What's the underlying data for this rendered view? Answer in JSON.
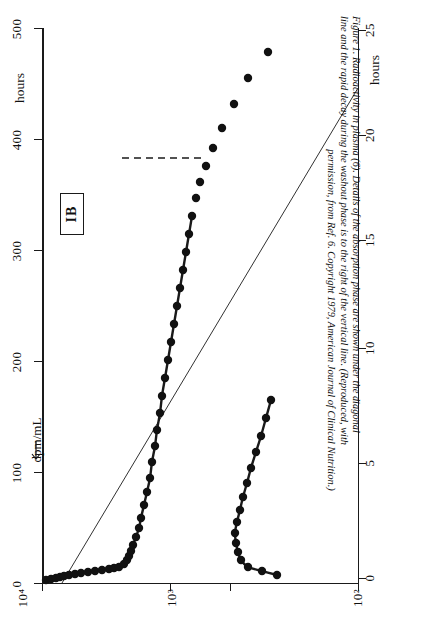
{
  "figure": {
    "panel_label": "IB",
    "caption_lines": [
      "Figure 1.   Radioactivity in plasma (6).  Details of the absorption phase are shown under the diagonal",
      "line and the rapid decay during the washout phase is to the right of the vertical line.  (Reproduced, with",
      "permission, from Ref. 6.  Copyright 1979, American Journal of Clinical Nutrition.)"
    ],
    "ink_color": "#1a1a1a",
    "background": "#ffffff"
  },
  "chart_data": {
    "type": "scatter",
    "title": "Radioactivity in plasma",
    "orientation": "rotated-90",
    "xlabel": "dpm/mL",
    "ylabel": "hours",
    "ylim": [
      0,
      500
    ],
    "yticks": [
      0,
      100,
      200,
      300,
      400,
      500
    ],
    "ytick_labels": [
      "0",
      "100",
      "200",
      "300",
      "400",
      "500"
    ],
    "y_axis_title": "hours",
    "x_scale": "log-descending",
    "xlim": [
      10000,
      100
    ],
    "xticks": [
      10000,
      1000,
      100
    ],
    "xtick_labels": [
      "10⁴",
      "10³",
      "10²"
    ],
    "x_axis_title": "dpm/mL",
    "secondary_axis": {
      "label": "hours",
      "ticks": [
        0,
        5,
        10,
        15,
        20,
        25
      ],
      "tick_labels": [
        "0",
        "5",
        "10",
        "15",
        "20",
        "25"
      ],
      "position": "right-and-bottom"
    },
    "grid": false,
    "legend": false,
    "series": [
      {
        "name": "absorption-phase",
        "style": "filled-circles-with-fitted-curve",
        "marker": "filled-circle",
        "points_px": [
          [
            46,
            580
          ],
          [
            51,
            579
          ],
          [
            56,
            578
          ],
          [
            60,
            577
          ],
          [
            64,
            576
          ],
          [
            69,
            575
          ],
          [
            75,
            574
          ],
          [
            81,
            573
          ],
          [
            88,
            572
          ],
          [
            95,
            571
          ],
          [
            102,
            570
          ],
          [
            109,
            569
          ],
          [
            114,
            568
          ],
          [
            119,
            567
          ],
          [
            124,
            564
          ],
          [
            127,
            560
          ],
          [
            129,
            556
          ],
          [
            131,
            551
          ],
          [
            133,
            545
          ],
          [
            136,
            537
          ],
          [
            139,
            528
          ],
          [
            141,
            518
          ],
          [
            144,
            505
          ],
          [
            147,
            492
          ],
          [
            150,
            478
          ],
          [
            152,
            462
          ],
          [
            155,
            446
          ],
          [
            157,
            430
          ],
          [
            160,
            413
          ],
          [
            162,
            396
          ],
          [
            165,
            378
          ],
          [
            168,
            360
          ],
          [
            171,
            342
          ],
          [
            174,
            324
          ],
          [
            177,
            306
          ],
          [
            180,
            288
          ],
          [
            183,
            270
          ],
          [
            186,
            252
          ],
          [
            189,
            234
          ],
          [
            192,
            216
          ]
        ]
      },
      {
        "name": "washout-phase",
        "style": "filled-circles-with-fitted-curve",
        "marker": "filled-circle",
        "points_px": [
          [
            277,
            575
          ],
          [
            262,
            571
          ],
          [
            248,
            567
          ],
          [
            241,
            560
          ],
          [
            238,
            552
          ],
          [
            236,
            543
          ],
          [
            235,
            533
          ],
          [
            237,
            522
          ],
          [
            240,
            510
          ],
          [
            243,
            497
          ],
          [
            247,
            483
          ],
          [
            251,
            468
          ],
          [
            256,
            452
          ],
          [
            261,
            436
          ],
          [
            266,
            418
          ],
          [
            271,
            400
          ]
        ]
      },
      {
        "name": "upper-scattered-points",
        "style": "filled-circles",
        "marker": "filled-circle",
        "points_px": [
          [
            196,
            198
          ],
          [
            200,
            182
          ],
          [
            206,
            166
          ],
          [
            213,
            148
          ],
          [
            222,
            128
          ],
          [
            234,
            104
          ],
          [
            248,
            78
          ],
          [
            268,
            52
          ]
        ]
      }
    ],
    "annotations": [
      {
        "type": "dashed-horizontal-line",
        "label": "plateau-reference",
        "y_px": 158,
        "x1_px": 122,
        "x2_px": 206
      },
      {
        "type": "diagonal-line",
        "label": "diagonal-reference",
        "x1_px": 62,
        "y1_px": 583,
        "x2_px": 358,
        "y2_px": 88
      },
      {
        "type": "arrow",
        "label": "dpm-per-mL-pointer",
        "x_px": 36,
        "y_px": 450
      }
    ]
  },
  "axes": {
    "left": {
      "title": "hours",
      "ticks": [
        {
          "label": "500",
          "y_px": 28
        },
        {
          "label": "400",
          "y_px": 139
        },
        {
          "label": "300",
          "y_px": 250
        },
        {
          "label": "200",
          "y_px": 361
        },
        {
          "label": "100",
          "y_px": 472
        },
        {
          "label": "0",
          "y_px": 583
        }
      ]
    },
    "bottom": {
      "title": "dpm/mL",
      "ticks": [
        {
          "label": "10⁴",
          "x_px": 42
        },
        {
          "label": "10³",
          "x_px": 170
        },
        {
          "label": "10²",
          "x_px": 358
        }
      ],
      "minor_ticks_px": [
        230
      ]
    },
    "right": {
      "title": "hours",
      "ticks": [
        {
          "label": "25",
          "y_px": 30
        },
        {
          "label": "20",
          "y_px": 135
        },
        {
          "label": "15",
          "y_px": 240
        },
        {
          "label": "10",
          "y_px": 348
        },
        {
          "label": "5",
          "y_px": 463
        },
        {
          "label": "0",
          "y_px": 578
        }
      ]
    }
  }
}
